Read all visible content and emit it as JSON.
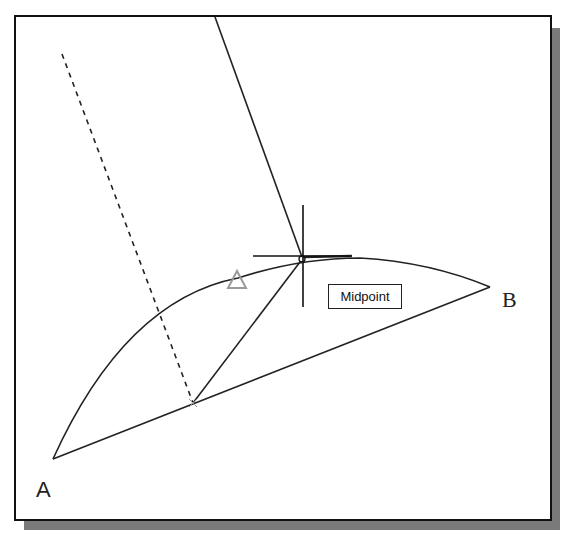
{
  "diagram": {
    "points": {
      "A": {
        "label": "A",
        "x": 53,
        "y": 459
      },
      "B": {
        "label": "B",
        "x": 490,
        "y": 287
      },
      "midpoint_AB": {
        "x": 193,
        "y": 403
      },
      "cursor": {
        "x": 302,
        "y": 257
      }
    },
    "tooltip": {
      "text": "Midpoint"
    },
    "snap_marker": {
      "shape": "triangle",
      "color": "#9a9a9a"
    },
    "colors": {
      "line": "#222222",
      "frame": "#111111",
      "shadow": "#7a7a7a"
    }
  }
}
